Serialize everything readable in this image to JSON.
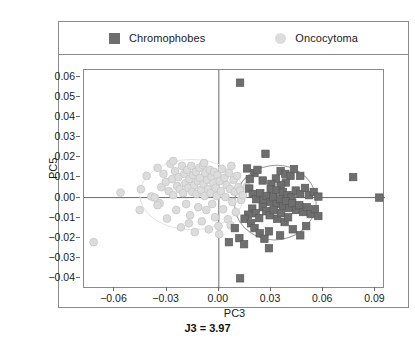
{
  "legend": {
    "entries": [
      {
        "label": "Chromophobes",
        "marker": "square-marker-icon",
        "color": "#6e6e6e"
      },
      {
        "label": "Oncocytoma",
        "marker": "circle-marker-icon",
        "color": "#dcdcdc"
      }
    ]
  },
  "caption": "J3 = 3.97",
  "chart_data": {
    "type": "scatter",
    "title": "",
    "subtitle": "",
    "xlabel": "PC3",
    "ylabel": "PC5",
    "xlim": [
      -0.0775,
      0.0955
    ],
    "ylim": [
      -0.0455,
      0.0635
    ],
    "xticks": [
      -0.06,
      -0.03,
      0.0,
      0.03,
      0.06,
      0.09
    ],
    "xticklabels": [
      "−0.06",
      "−0.03",
      "0.00",
      "0.03",
      "0.06",
      "0.09"
    ],
    "yticks": [
      -0.04,
      -0.03,
      -0.02,
      -0.01,
      0.0,
      0.01,
      0.02,
      0.03,
      0.04,
      0.05,
      0.06
    ],
    "yticklabels": [
      "−0.04",
      "−0.03",
      "−0.02",
      "−0.01",
      "0.00",
      "0.01",
      "0.02",
      "0.03",
      "0.04",
      "0.05",
      "0.06"
    ],
    "grid": false,
    "reference_lines": {
      "x": 0.0,
      "y": 0.0,
      "color": "#6a6a6a"
    },
    "legend_position": "top",
    "annotation": "J3 = 3.97",
    "series": [
      {
        "name": "Oncocytoma",
        "marker": "circle",
        "color": "#dcdcdc",
        "edgecolor": "#c4c4c4",
        "points": [
          [
            -0.072,
            -0.0222
          ],
          [
            -0.0565,
            0.0025
          ],
          [
            -0.0455,
            -0.0062
          ],
          [
            -0.0415,
            0.0108
          ],
          [
            -0.0388,
            0.0006
          ],
          [
            -0.0368,
            0.0
          ],
          [
            -0.0352,
            0.0148
          ],
          [
            -0.034,
            -0.0028
          ],
          [
            -0.033,
            0.0052
          ],
          [
            -0.0318,
            0.0118
          ],
          [
            -0.0305,
            0.0078
          ],
          [
            -0.0298,
            -0.0104
          ],
          [
            -0.0288,
            0.0032
          ],
          [
            -0.0278,
            0.0168
          ],
          [
            -0.0268,
            0.0092
          ],
          [
            -0.0262,
            0.0012
          ],
          [
            -0.0252,
            0.0132
          ],
          [
            -0.0245,
            -0.0062
          ],
          [
            -0.024,
            0.0058
          ],
          [
            -0.0232,
            0.0102
          ],
          [
            -0.0225,
            0.0042
          ],
          [
            -0.0218,
            -0.0148
          ],
          [
            -0.0212,
            0.0158
          ],
          [
            -0.0205,
            0.0022
          ],
          [
            -0.0198,
            0.0118
          ],
          [
            -0.0192,
            0.0072
          ],
          [
            -0.0188,
            -0.0032
          ],
          [
            -0.0182,
            0.0138
          ],
          [
            -0.0175,
            0.0048
          ],
          [
            -0.017,
            0.0092
          ],
          [
            -0.0165,
            -0.0088
          ],
          [
            -0.0158,
            0.0158
          ],
          [
            -0.0152,
            0.0028
          ],
          [
            -0.0148,
            0.0112
          ],
          [
            -0.0142,
            0.0062
          ],
          [
            -0.0138,
            -0.0172
          ],
          [
            -0.0132,
            0.0128
          ],
          [
            -0.0128,
            0.0018
          ],
          [
            -0.0122,
            0.0082
          ],
          [
            -0.0118,
            -0.0048
          ],
          [
            -0.0112,
            0.0148
          ],
          [
            -0.0108,
            0.0098
          ],
          [
            -0.0102,
            0.0038
          ],
          [
            -0.0098,
            -0.0118
          ],
          [
            -0.0092,
            0.0162
          ],
          [
            -0.0088,
            0.0068
          ],
          [
            -0.0082,
            0.0008
          ],
          [
            -0.0078,
            0.0122
          ],
          [
            -0.0072,
            -0.0062
          ],
          [
            -0.0068,
            0.0088
          ],
          [
            -0.0062,
            0.0042
          ],
          [
            -0.0058,
            -0.0158
          ],
          [
            -0.0052,
            0.0138
          ],
          [
            -0.0048,
            0.0022
          ],
          [
            -0.0042,
            0.0102
          ],
          [
            -0.0038,
            -0.0032
          ],
          [
            -0.0032,
            0.0072
          ],
          [
            -0.0028,
            0.0128
          ],
          [
            -0.0022,
            -0.0098
          ],
          [
            -0.0018,
            0.0048
          ],
          [
            -0.0012,
            0.0008
          ],
          [
            -0.0008,
            0.0112
          ],
          [
            -0.0002,
            -0.0142
          ],
          [
            0.0005,
            0.0082
          ],
          [
            0.0012,
            0.0032
          ],
          [
            0.0018,
            0.0142
          ],
          [
            0.0025,
            -0.0058
          ],
          [
            0.0032,
            0.0098
          ],
          [
            0.0038,
            0.0002
          ],
          [
            0.0045,
            0.0062
          ],
          [
            0.0052,
            -0.0108
          ],
          [
            0.0058,
            0.0122
          ],
          [
            0.0065,
            0.0042
          ],
          [
            0.0072,
            0.0158
          ],
          [
            0.0078,
            -0.0022
          ],
          [
            0.0085,
            0.0088
          ],
          [
            0.0092,
            0.0028
          ],
          [
            0.0098,
            -0.0072
          ],
          [
            0.0105,
            0.0108
          ],
          [
            0.0112,
            0.0052
          ],
          [
            0.0122,
            0.0035
          ],
          [
            -0.0448,
            0.0042
          ],
          [
            -0.0352,
            -0.0038
          ],
          [
            -0.0262,
            0.0182
          ],
          [
            -0.0172,
            -0.0128
          ],
          [
            -0.0085,
            0.0172
          ],
          [
            0.0002,
            -0.0182
          ],
          [
            0.0068,
            -0.0138
          ],
          [
            0.0128,
            -0.0012
          ],
          [
            0.0138,
            0.0012
          ],
          [
            0.0162,
            0.0055
          ]
        ],
        "ellipse": {
          "cx": -0.0155,
          "cy": 0.0015,
          "rx": 0.03,
          "ry": 0.0175,
          "angle": 0,
          "color": "#e4e4e4"
        }
      },
      {
        "name": "Chromophobes",
        "marker": "square",
        "color": "#6e6e6e",
        "edgecolor": "#5a5a5a",
        "points": [
          [
            0.0122,
            0.0572
          ],
          [
            0.0268,
            0.0218
          ],
          [
            0.0162,
            0.0145
          ],
          [
            0.0205,
            0.0122
          ],
          [
            0.0178,
            0.0092
          ],
          [
            0.0222,
            0.0138
          ],
          [
            0.0252,
            0.0085
          ],
          [
            0.0355,
            0.0132
          ],
          [
            0.0382,
            0.0118
          ],
          [
            0.0412,
            0.0108
          ],
          [
            0.0385,
            0.0075
          ],
          [
            0.0355,
            0.0062
          ],
          [
            0.0328,
            0.0095
          ],
          [
            0.0302,
            0.0068
          ],
          [
            0.0298,
            0.0042
          ],
          [
            0.0332,
            0.0035
          ],
          [
            0.0368,
            0.0028
          ],
          [
            0.0395,
            0.0012
          ],
          [
            0.0418,
            0.0002
          ],
          [
            0.0442,
            0.0035
          ],
          [
            0.0468,
            0.0018
          ],
          [
            0.0495,
            0.0048
          ],
          [
            0.0518,
            0.0012
          ],
          [
            0.0545,
            0.0028
          ],
          [
            0.0572,
            0.0005
          ],
          [
            0.0175,
            0.0045
          ],
          [
            0.0195,
            0.0018
          ],
          [
            0.0215,
            -0.0008
          ],
          [
            0.0238,
            0.0022
          ],
          [
            0.0258,
            -0.0012
          ],
          [
            0.0275,
            0.0008
          ],
          [
            0.0295,
            -0.0022
          ],
          [
            0.0312,
            0.0002
          ],
          [
            0.0332,
            -0.0032
          ],
          [
            0.0352,
            -0.0008
          ],
          [
            0.0368,
            -0.0042
          ],
          [
            0.0385,
            -0.0018
          ],
          [
            0.0405,
            -0.0052
          ],
          [
            0.0422,
            -0.0028
          ],
          [
            0.0445,
            -0.0062
          ],
          [
            0.0462,
            -0.0038
          ],
          [
            0.0485,
            -0.0072
          ],
          [
            0.0505,
            -0.0048
          ],
          [
            0.0528,
            -0.0082
          ],
          [
            0.0552,
            -0.0058
          ],
          [
            0.0572,
            -0.0092
          ],
          [
            0.0252,
            -0.0048
          ],
          [
            0.0272,
            -0.0068
          ],
          [
            0.0292,
            -0.0088
          ],
          [
            0.0315,
            -0.0062
          ],
          [
            0.0335,
            -0.0105
          ],
          [
            0.0358,
            -0.0078
          ],
          [
            0.0378,
            -0.0122
          ],
          [
            0.0398,
            -0.0098
          ],
          [
            0.0192,
            -0.0055
          ],
          [
            0.0212,
            -0.0078
          ],
          [
            0.0232,
            -0.0102
          ],
          [
            0.0168,
            -0.0085
          ],
          [
            0.0148,
            -0.0105
          ],
          [
            0.0185,
            -0.0128
          ],
          [
            0.0205,
            -0.0152
          ],
          [
            0.0235,
            -0.0178
          ],
          [
            0.0262,
            -0.0205
          ],
          [
            0.0288,
            -0.0168
          ],
          [
            0.0118,
            -0.0202
          ],
          [
            0.0145,
            -0.0232
          ],
          [
            0.0352,
            -0.0188
          ],
          [
            0.0425,
            -0.0158
          ],
          [
            0.0468,
            -0.0188
          ],
          [
            0.0502,
            -0.0142
          ],
          [
            0.0122,
            -0.0402
          ],
          [
            0.0092,
            -0.0152
          ],
          [
            0.0058,
            -0.0222
          ],
          [
            0.0772,
            0.0102
          ],
          [
            0.0922,
            0.0
          ],
          [
            0.0468,
            0.0108
          ],
          [
            0.0432,
            0.0142
          ],
          [
            0.0288,
            -0.0252
          ]
        ],
        "ellipse": {
          "cx": 0.0325,
          "cy": -0.0025,
          "rx": 0.0235,
          "ry": 0.0185,
          "angle": -8,
          "color": "#9a9a9a"
        }
      }
    ]
  }
}
